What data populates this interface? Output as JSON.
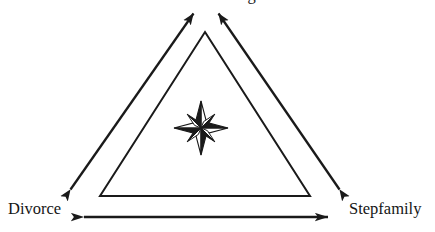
{
  "figure": {
    "type": "triangle-relationship-diagram",
    "background_color": "#ffffff",
    "stroke_color": "#1a1a1a",
    "width": 435,
    "height": 232
  },
  "labels": {
    "apex": "Remarriage",
    "bottom_left": "Divorce",
    "bottom_right": "Stepfamily"
  },
  "center_ornament": {
    "name": "compass-rose-star",
    "points": 8,
    "fill_dark": "#1a1a1a",
    "fill_light": "#ffffff",
    "center_x": 201,
    "center_y": 128
  },
  "inner_triangle": {
    "apex": [
      205,
      32
    ],
    "bottom_left": [
      100,
      196
    ],
    "bottom_right": [
      310,
      196
    ],
    "stroke_width": 2
  },
  "arrows": [
    {
      "name": "divorce-to-apex",
      "double_headed": true,
      "from": [
        68,
        193
      ],
      "to": [
        196,
        10
      ]
    },
    {
      "name": "stepfamily-to-apex",
      "double_headed": true,
      "from": [
        342,
        193
      ],
      "to": [
        216,
        10
      ]
    },
    {
      "name": "divorce-to-stepfamily",
      "double_headed": true,
      "from": [
        80,
        217
      ],
      "to": [
        332,
        217
      ]
    }
  ]
}
